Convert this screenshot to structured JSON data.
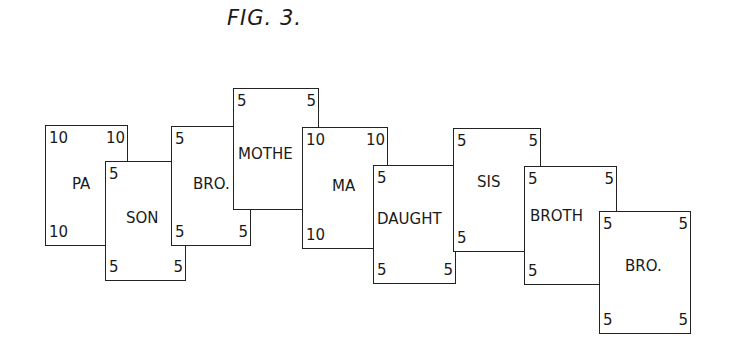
{
  "figure": {
    "title": "FIG. 3."
  },
  "cards": [
    {
      "id": "pa",
      "label": "PA",
      "tl": "10",
      "tr": "10",
      "bl": "10",
      "br": ""
    },
    {
      "id": "son",
      "label": "SON",
      "tl": "5",
      "tr": "",
      "bl": "5",
      "br": "5"
    },
    {
      "id": "bro1",
      "label": "BRO.",
      "tl": "5",
      "tr": "",
      "bl": "5",
      "br": "5"
    },
    {
      "id": "mothe",
      "label": "MOTHE",
      "tl": "5",
      "tr": "5",
      "bl": "",
      "br": ""
    },
    {
      "id": "ma",
      "label": "MA",
      "tl": "10",
      "tr": "10",
      "bl": "10",
      "br": ""
    },
    {
      "id": "daught",
      "label": "DAUGHT",
      "tl": "5",
      "tr": "",
      "bl": "5",
      "br": "5"
    },
    {
      "id": "sis",
      "label": "SIS",
      "tl": "5",
      "tr": "5",
      "bl": "5",
      "br": ""
    },
    {
      "id": "broth",
      "label": "BROTH",
      "tl": "5",
      "tr": "5",
      "bl": "5",
      "br": ""
    },
    {
      "id": "bro2",
      "label": "BRO.",
      "tl": "5",
      "tr": "5",
      "bl": "5",
      "br": "5"
    }
  ]
}
